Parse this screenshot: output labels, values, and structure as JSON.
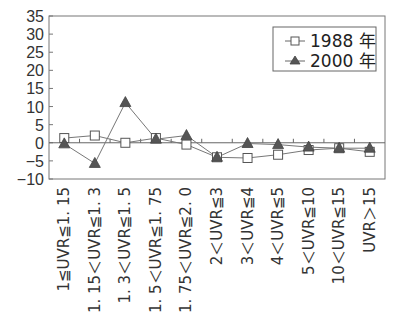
{
  "chart_data": {
    "type": "line",
    "title": "",
    "xlabel": "",
    "ylabel": "",
    "ylim": [
      -10,
      35
    ],
    "yticks": [
      35,
      30,
      25,
      20,
      15,
      10,
      5,
      0,
      -5,
      -10
    ],
    "grid": false,
    "legend_position": "upper right inside",
    "categories": [
      "1≦UVR≦1. 15",
      "1. 15＜UVR≦1. 3",
      "1. 3＜UVR≦1. 5",
      "1. 5＜UVR≦1. 75",
      "1. 75＜UVR≦2. 0",
      "2＜UVR≦3",
      "3＜UVR≦4",
      "4＜UVR≦5",
      "5＜UVR≦10",
      "10＜UVR≦15",
      "UVR＞15"
    ],
    "series": [
      {
        "name": "1988 年",
        "marker": "square-open",
        "color": "#555555",
        "values": [
          1.3,
          2.0,
          0.0,
          1.3,
          -0.5,
          -4.0,
          -4.2,
          -3.3,
          -2.0,
          -1.5,
          -2.5
        ]
      },
      {
        "name": "2000 年",
        "marker": "triangle-filled",
        "color": "#555555",
        "values": [
          -0.3,
          -5.7,
          11.1,
          1.0,
          2.0,
          -4.0,
          -0.2,
          -0.5,
          -1.2,
          -1.5,
          -1.5
        ]
      }
    ]
  },
  "legend": {
    "items": [
      {
        "label": "1988 年"
      },
      {
        "label": "2000 年"
      }
    ]
  }
}
